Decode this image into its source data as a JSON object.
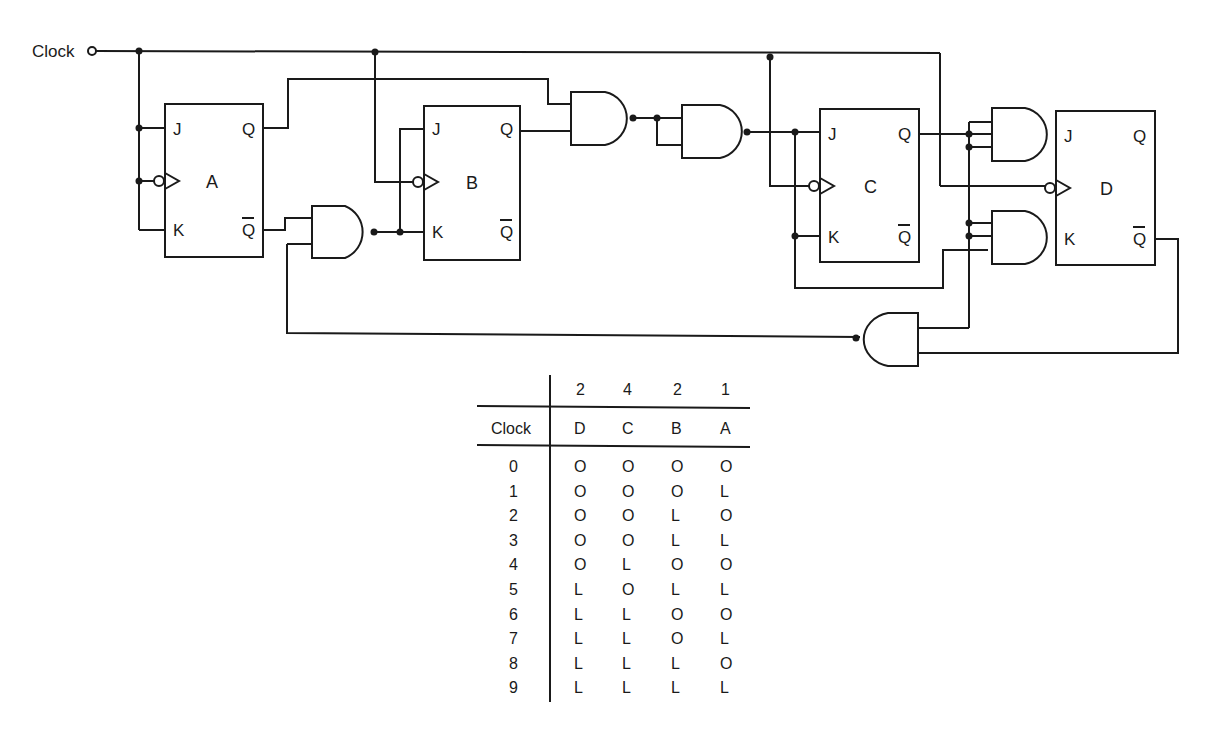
{
  "circuit": {
    "input_label": "Clock",
    "flipflops": [
      {
        "id": "A",
        "name": "A",
        "pins": {
          "j": "J",
          "k": "K",
          "q": "Q",
          "qbar": "Q"
        }
      },
      {
        "id": "B",
        "name": "B",
        "pins": {
          "j": "J",
          "k": "K",
          "q": "Q",
          "qbar": "Q"
        }
      },
      {
        "id": "C",
        "name": "C",
        "pins": {
          "j": "J",
          "k": "K",
          "q": "Q",
          "qbar": "Q"
        }
      },
      {
        "id": "D",
        "name": "D",
        "pins": {
          "j": "J",
          "k": "K",
          "q": "Q",
          "qbar": "Q"
        }
      }
    ],
    "gates": [
      "and-gate-ab",
      "and-gate-b-feedback",
      "and-gate-1",
      "and-gate-2",
      "and-gate-d-j",
      "and-gate-d-k",
      "and-gate-feedback"
    ]
  },
  "table": {
    "weights": [
      "2",
      "4",
      "2",
      "1"
    ],
    "header": {
      "clock": "Clock",
      "columns": [
        "D",
        "C",
        "B",
        "A"
      ]
    },
    "rows": [
      {
        "clock": "0",
        "values": [
          "O",
          "O",
          "O",
          "O"
        ]
      },
      {
        "clock": "1",
        "values": [
          "O",
          "O",
          "O",
          "L"
        ]
      },
      {
        "clock": "2",
        "values": [
          "O",
          "O",
          "L",
          "O"
        ]
      },
      {
        "clock": "3",
        "values": [
          "O",
          "O",
          "L",
          "L"
        ]
      },
      {
        "clock": "4",
        "values": [
          "O",
          "L",
          "O",
          "O"
        ]
      },
      {
        "clock": "5",
        "values": [
          "L",
          "O",
          "L",
          "L"
        ]
      },
      {
        "clock": "6",
        "values": [
          "L",
          "L",
          "O",
          "O"
        ]
      },
      {
        "clock": "7",
        "values": [
          "L",
          "L",
          "O",
          "L"
        ]
      },
      {
        "clock": "8",
        "values": [
          "L",
          "L",
          "L",
          "O"
        ]
      },
      {
        "clock": "9",
        "values": [
          "L",
          "L",
          "L",
          "L"
        ]
      }
    ]
  }
}
